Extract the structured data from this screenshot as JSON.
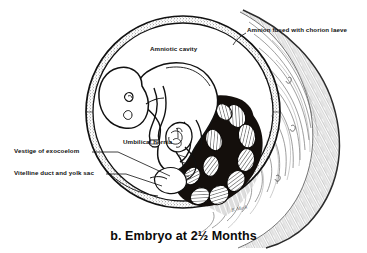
{
  "figure": {
    "caption": "b. Embryo at 2½ Months",
    "signature": "B. Mark",
    "background_color": "#ffffff",
    "ink_color": "#111111",
    "placenta_color": "#1a1410",
    "uterine_wall_color": "#8d8d8d"
  },
  "labels": {
    "amnion_chorion": "Amnion fused with chorion laeve",
    "amniotic_cavity": "Amniotic cavity",
    "umbilical_hernia": "Umbilical hernia",
    "vestige_exocoelom": "Vestige of exocoelom",
    "vitelline_duct": "Vitelline duct and yolk sac"
  },
  "structures": {
    "amnion_ring": "amnion-membrane-ring",
    "embryo": "curled-embryo-figure",
    "placenta": "placental-cotyledons",
    "uterine_wall": "uterine-wall-myometrium",
    "umbilical_cord": "umbilical-cord",
    "yolk_sac": "yolk-sac"
  }
}
